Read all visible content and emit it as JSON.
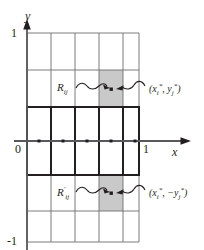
{
  "figure": {
    "kind": "math-diagram",
    "colors": {
      "ink": "#231f20",
      "grid": "#6d6e71",
      "axis": "#58595b",
      "shade": "#c9c9c9",
      "bold_band": "#231f20",
      "background": "#ffffff"
    }
  },
  "axes": {
    "y_axis": {
      "name": "y-axis",
      "label": "y",
      "arrow": "up"
    },
    "x_axis": {
      "name": "x-axis",
      "label": "x",
      "arrow": "right"
    },
    "ticks": {
      "y_top": "1",
      "y_bottom": "-1",
      "x_origin": "0",
      "x_right": "1"
    }
  },
  "grid": {
    "columns": 5,
    "rows_upper": 3,
    "rows_lower": 3,
    "x_range": [
      0,
      1
    ],
    "y_range": [
      -1,
      1
    ]
  },
  "shaded_cells": [
    {
      "name": "upper-shaded-cell",
      "column": 4,
      "half": "upper"
    },
    {
      "name": "lower-shaded-cell",
      "column": 4,
      "half": "lower"
    }
  ],
  "bold_band": {
    "name": "bold-band-straddling-x-axis",
    "cells": 5,
    "sample_points": 5
  },
  "annotations": {
    "upper_region": {
      "label_base": "R",
      "label_sub": "ij",
      "prime": ""
    },
    "lower_region": {
      "label_base": "R",
      "label_sub": "ij",
      "prime": "′"
    },
    "upper_point": {
      "open": "(",
      "x_base": "x",
      "x_sub": "i",
      "x_star": "*",
      "comma": ", ",
      "y_sign": "",
      "y_base": "y",
      "y_sub": "j",
      "y_star": "*",
      "close": ")"
    },
    "lower_point": {
      "open": "(",
      "x_base": "x",
      "x_sub": "i",
      "x_star": "*",
      "comma": ", ",
      "y_sign": "−",
      "y_base": "y",
      "y_sub": "j",
      "y_star": "*",
      "close": ")"
    }
  },
  "sample_dots": {
    "name": "sample-point-dot",
    "count_on_axis": 5,
    "count_in_shaded": 2
  }
}
